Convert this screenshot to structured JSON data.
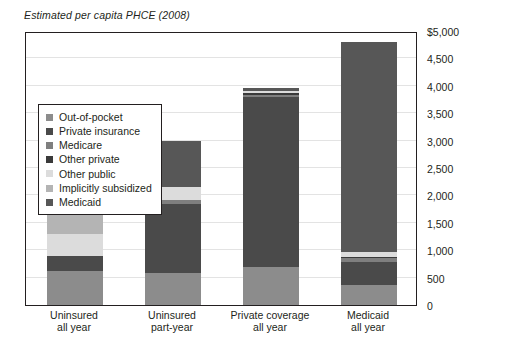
{
  "chart_data": {
    "type": "bar",
    "subtype": "stacked-vertical",
    "title": "Estimated per capita PHCE (2008)",
    "xlabel": "",
    "ylabel": "",
    "ylim": [
      0,
      5000
    ],
    "ytick_step": 500,
    "ytick_labels": [
      "$5,000",
      "4,500",
      "4,000",
      "3,500",
      "3,000",
      "2,500",
      "2,000",
      "1,500",
      "1,000",
      "500",
      "0"
    ],
    "ytick_values": [
      5000,
      4500,
      4000,
      3500,
      3000,
      2500,
      2000,
      1500,
      1000,
      500,
      0
    ],
    "grid": true,
    "grid_axis": "y",
    "legend_position": "inside-left",
    "categories": [
      {
        "line1": "Uninsured",
        "line2": "all year"
      },
      {
        "line1": "Uninsured",
        "line2": "part-year"
      },
      {
        "line1": "Private coverage",
        "line2": "all year"
      },
      {
        "line1": "Medicaid",
        "line2": "all year"
      }
    ],
    "category_labels": [
      "Uninsured all year",
      "Uninsured part-year",
      "Private coverage all year",
      "Medicaid all year"
    ],
    "series": [
      {
        "name": "Out-of-pocket",
        "color": "#8c8c8c",
        "values": [
          620,
          590,
          700,
          360
        ]
      },
      {
        "name": "Private insurance",
        "color": "#4a4a4a",
        "values": [
          280,
          1260,
          3090,
          430
        ]
      },
      {
        "name": "Medicare",
        "color": "#7f7f7f",
        "values": [
          0,
          75,
          45,
          60
        ]
      },
      {
        "name": "Other private",
        "color": "#3a3a3a",
        "values": [
          0,
          0,
          30,
          25
        ]
      },
      {
        "name": "Other public",
        "color": "#dcdcdc",
        "values": [
          390,
          230,
          35,
          90
        ]
      },
      {
        "name": "Implicitly subsidized",
        "color": "#b4b4b4",
        "values": [
          430,
          0,
          0,
          0
        ]
      },
      {
        "name": "Medicaid",
        "color": "#575757",
        "values": [
          0,
          830,
          60,
          3840
        ]
      }
    ],
    "totals": [
      1720,
      2985,
      3960,
      4805
    ]
  },
  "legend": {
    "items": [
      {
        "label": "Out-of-pocket",
        "color": "#8c8c8c"
      },
      {
        "label": "Private insurance",
        "color": "#4a4a4a"
      },
      {
        "label": "Medicare",
        "color": "#7f7f7f"
      },
      {
        "label": "Other private",
        "color": "#3a3a3a"
      },
      {
        "label": "Other public",
        "color": "#dcdcdc"
      },
      {
        "label": "Implicitly subsidized",
        "color": "#b4b4b4"
      },
      {
        "label": "Medicaid",
        "color": "#575757"
      }
    ]
  },
  "style": {
    "axis_color": "#231f20",
    "grid_color": "#e3e3e3",
    "background": "#ffffff"
  }
}
